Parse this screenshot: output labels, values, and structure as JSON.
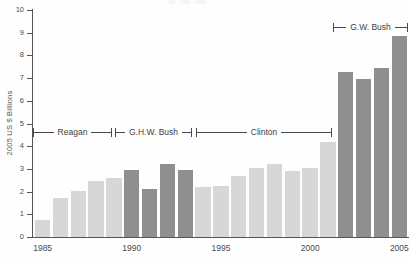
{
  "chart_data": {
    "type": "bar",
    "title": "",
    "xlabel": "",
    "ylabel": "2005 US $ Billions",
    "ylim": [
      0,
      10
    ],
    "yticks": [
      0,
      1,
      2,
      3,
      4,
      5,
      6,
      7,
      8,
      9,
      10
    ],
    "xtick_years": [
      1985,
      1990,
      1995,
      2000,
      2005
    ],
    "grid": false,
    "legend": "none",
    "categories": [
      1985,
      1986,
      1987,
      1988,
      1989,
      1990,
      1991,
      1992,
      1993,
      1994,
      1995,
      1996,
      1997,
      1998,
      1999,
      2000,
      2001,
      2002,
      2003,
      2004,
      2005
    ],
    "values": [
      0.75,
      1.7,
      2.05,
      2.45,
      2.6,
      2.95,
      2.1,
      3.2,
      2.95,
      2.2,
      2.25,
      2.7,
      3.05,
      3.2,
      2.9,
      3.05,
      4.2,
      7.25,
      6.95,
      7.45,
      8.85
    ],
    "bar_color_keys": [
      "light",
      "light",
      "light",
      "light",
      "light",
      "dark",
      "dark",
      "dark",
      "dark",
      "light",
      "light",
      "light",
      "light",
      "light",
      "light",
      "light",
      "light",
      "dark",
      "dark",
      "dark",
      "dark"
    ],
    "colors": {
      "light_bar": "#d7d7d7",
      "dark_bar": "#8f8f8f",
      "axis": "#555555",
      "text": "#4a4a4a",
      "background": "#fefefe"
    },
    "annotations": [
      {
        "label": "Reagan",
        "x1_px": 33,
        "x2_px": 112,
        "y_value": 4.6,
        "start_year": 1985,
        "end_year": 1989
      },
      {
        "label": "G.H.W. Bush",
        "x1_px": 115,
        "x2_px": 192,
        "y_value": 4.6,
        "start_year": 1989,
        "end_year": 1993
      },
      {
        "label": "Clinton",
        "x1_px": 196,
        "x2_px": 332,
        "y_value": 4.6,
        "start_year": 1993,
        "end_year": 2001
      },
      {
        "label": "G.W. Bush",
        "x1_px": 333,
        "x2_px": 408,
        "y_value": 9.25,
        "start_year": 2001,
        "end_year": 2005
      }
    ]
  }
}
